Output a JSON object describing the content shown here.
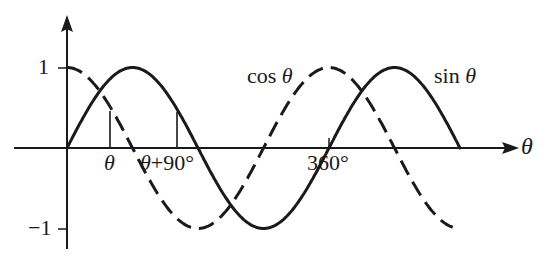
{
  "chart_data": {
    "type": "line",
    "title": "",
    "xlabel": "θ",
    "ylabel": "",
    "ylim": [
      -1,
      1
    ],
    "xlim_degrees": [
      0,
      540
    ],
    "grid": false,
    "series": [
      {
        "name": "sin θ",
        "style": "solid",
        "x_degrees": [
          0,
          90,
          180,
          270,
          360,
          450,
          540
        ],
        "values": [
          0,
          1,
          0,
          -1,
          0,
          1,
          0
        ]
      },
      {
        "name": "cos θ",
        "style": "dashed",
        "x_degrees": [
          0,
          90,
          180,
          270,
          360,
          450,
          530
        ],
        "values": [
          1,
          0,
          -1,
          0,
          1,
          0,
          -0.98
        ]
      }
    ],
    "y_ticks": [
      "1",
      "−1"
    ],
    "x_annotations": [
      "θ",
      "θ+90°",
      "360°"
    ],
    "annotations": [
      {
        "text": "θ",
        "note": "vertical marker from axis to sin curve at θ ≈ 30°"
      },
      {
        "text": "θ+90°",
        "note": "vertical marker from axis to sin curve at θ+90° ≈ 120°"
      }
    ]
  },
  "labels": {
    "y_one": "1",
    "y_neg_one": "−1",
    "x_axis": "θ",
    "theta": "θ",
    "theta_plus_90_a": "θ",
    "theta_plus_90_b": "+90°",
    "x_360": "360°",
    "cos_label_a": "cos",
    "cos_label_b": "θ",
    "sin_label_a": "sin",
    "sin_label_b": "θ"
  },
  "colors": {
    "ink": "#1a1a1a",
    "background": "#ffffff"
  }
}
